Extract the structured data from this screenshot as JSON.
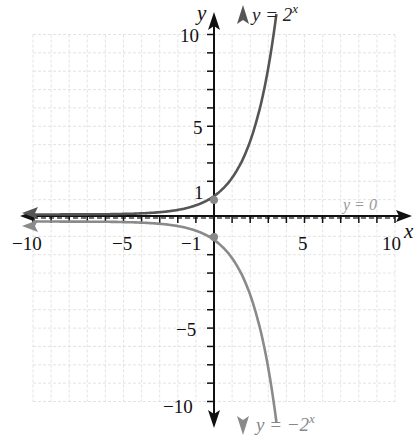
{
  "chart_data": {
    "type": "line",
    "title": "",
    "xlabel": "x",
    "ylabel": "y",
    "xlim": [
      -10,
      10
    ],
    "ylim": [
      -10,
      10
    ],
    "grid": true,
    "x_ticks": [
      -10,
      -5,
      5,
      10
    ],
    "y_ticks": [
      10,
      5,
      1,
      -1,
      -5,
      -10
    ],
    "series": [
      {
        "name": "y = 2^x",
        "function": "2^x",
        "color": "#555555",
        "points": [
          [
            -10,
            0.001
          ],
          [
            -5,
            0.031
          ],
          [
            -1,
            0.5
          ],
          [
            0,
            1
          ],
          [
            1,
            2
          ],
          [
            2,
            4
          ],
          [
            3,
            8
          ],
          [
            3.32,
            10
          ]
        ],
        "marked_point": [
          0,
          1
        ]
      },
      {
        "name": "y = -2^x",
        "function": "-2^x",
        "color": "#8a8a8a",
        "points": [
          [
            -10,
            -0.001
          ],
          [
            -5,
            -0.031
          ],
          [
            -1,
            -0.5
          ],
          [
            0,
            -1
          ],
          [
            1,
            -2
          ],
          [
            2,
            -4
          ],
          [
            3,
            -8
          ],
          [
            3.32,
            -10
          ]
        ],
        "marked_point": [
          0,
          -1
        ]
      }
    ],
    "asymptote": {
      "label": "y = 0",
      "y": 0,
      "style": "dashed"
    },
    "annotations": [
      "y = 2^x",
      "y = -2^x",
      "y = 0"
    ]
  },
  "labels": {
    "x_axis": "x",
    "y_axis": "y",
    "curve_top_prefix": "y = 2",
    "curve_top_exp": "x",
    "curve_bottom_prefix": "y = −2",
    "curve_bottom_exp": "x",
    "asymptote": "y = 0",
    "x_tick_neg10": "−10",
    "x_tick_neg5": "−5",
    "x_tick_5": "5",
    "x_tick_10": "10",
    "y_tick_10": "10",
    "y_tick_5": "5",
    "y_tick_1": "1",
    "y_tick_neg1": "−1",
    "y_tick_neg5": "−5",
    "y_tick_neg10": "−10"
  }
}
